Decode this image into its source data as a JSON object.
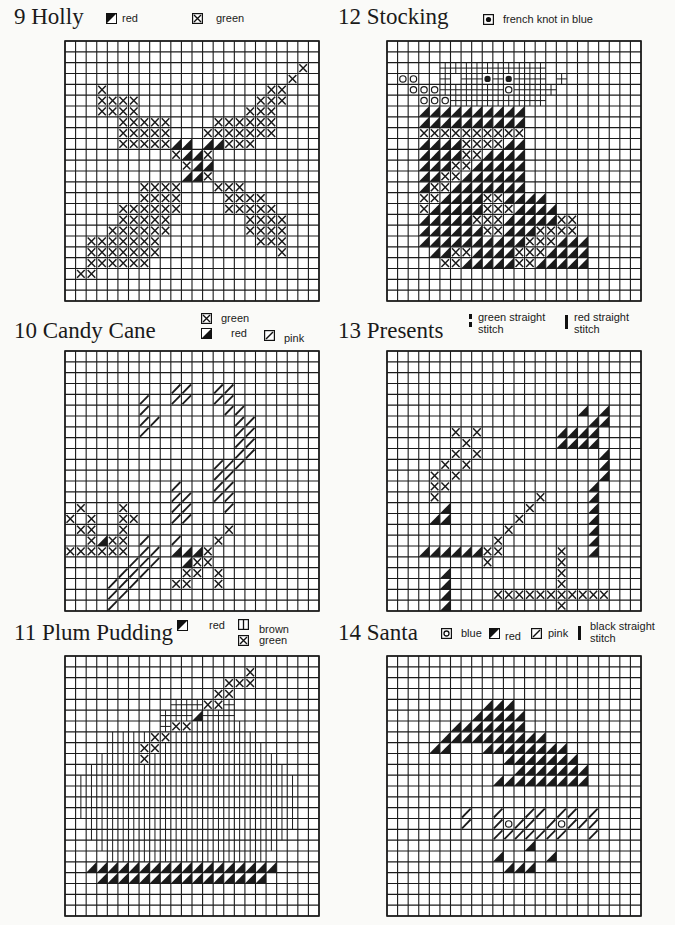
{
  "legend_symbols": {
    "X": "green-cross",
    "R": "red-half-fill",
    "P": "pink-diagonal",
    "O": "blue-circle",
    "K": "french-knot",
    "+": "white-cross-hatch",
    "B": "brown-vertical",
    "H": "brown-horizontal"
  },
  "panels": [
    {
      "id": "holly",
      "number": "9",
      "title": "9  Holly",
      "legend": [
        {
          "symbol": "red-half-fill-icon",
          "label": "red"
        },
        {
          "symbol": "green-cross-icon",
          "label": "green"
        }
      ],
      "rows": [
        "........................",
        "........................",
        "......................X.",
        ".....................X..",
        "...X...............XX...",
        "...XXXX...........XXX...",
        "...XXXX..........XXX....",
        ".....XXXXX....XXXXXX....",
        ".....XXXXX...XXXXXXX....",
        ".....XXXXXRR.RRXXX......",
        "..........XRRX..........",
        "...........XRR..........",
        "...........RRX..........",
        ".......XXXX...XXX.......",
        ".......XXXX....XXXX.....",
        ".....XXXXXX....XXXXX....",
        ".....XXXXX.......XXXX...",
        "....XXXXXX.......XXXX...",
        "..XXXXXXX.........XXX...",
        "..XXXXXXX...........X...",
        "..XXXXXX................",
        ".XX.....................",
        "........................",
        "........................"
      ]
    },
    {
      "id": "candy-cane",
      "number": "10",
      "title": "10  Candy Cane",
      "legend": [
        {
          "symbol": "green-cross-icon",
          "label": "green"
        },
        {
          "symbol": "red-half-fill-icon",
          "label": "red"
        },
        {
          "symbol": "pink-diagonal-icon",
          "label": "pink"
        }
      ],
      "rows": [
        "........................",
        "........................",
        "........................",
        "..........PP..PP........",
        ".......P..PP..PP........",
        ".......P.......PP.......",
        ".......PP.......PP......",
        ".......P........PP......",
        "................PP......",
        "................PP......",
        "..............PPP.......",
        "..............PP........",
        "..........P...PP........",
        "..........PP..PP........",
        ".X...X....PP...P........",
        "X.X..XX...PP............",
        ".XX..X.........X........",
        "..XRXX.P..P...X.........",
        "XXXXXX.PP.RRRX..........",
        "......PPP..RXX..........",
        ".....PPP...XX.X.........",
        "....PPP...XX..X.........",
        "....PP..................",
        "....P..................."
      ]
    },
    {
      "id": "plum-pudding",
      "number": "11",
      "title": "11  Plum Pudding",
      "legend": [
        {
          "symbol": "red-half-fill-icon",
          "label": "red"
        },
        {
          "symbol": "brown-vertical-icon",
          "label": "brown"
        },
        {
          "symbol": "green-cross-icon",
          "label": "green"
        }
      ],
      "rows": [
        "........................",
        ".................X......",
        "...............XXX......",
        "..............XX........",
        "..........HHHXXH........",
        ".........HHHRHHH........",
        ".........HXXBBBBB.......",
        "....BBBBXXBBBBBBBB......",
        "....BBBXXBBBBBBBBBB.....",
        "...BBBBXBBBBBBBBBBBB....",
        "..BBBBBBBBBBBBBBBBBBB...",
        ".BBBBBBBBBBBBBBBBBBBBB..",
        ".BBBBBBBBBBBBBBBBBBBBB..",
        ".BBBBBBBBBBBBBBBBBBBBB..",
        ".BBBBBBBBBBBBBBBBBBBBB..",
        "..BBBBBBBBBBBBBBBBBBBB..",
        "..BBBBBBBBBBBBBBBBBBB...",
        "...BBBBBBBBBBBBBBBBB....",
        "....BBBBBBBBBBBBBBB.....",
        "..RRRRRRRRRRRRRRRRRR....",
        "...RRRRRRRRRRRRRRRR.....",
        "........................",
        "........................",
        "........................"
      ]
    },
    {
      "id": "stocking",
      "number": "12",
      "title": "12  Stocking",
      "legend": [
        {
          "symbol": "french-knot-icon",
          "label": "french knot in blue"
        }
      ],
      "rows": [
        "........................",
        "........................",
        ".....++++++++++.........",
        ".OO..+.++K+K+++.+.......",
        "..OOO++++++O++++........",
        "...OOO+++++++++.........",
        "...RRRRRRRRRR...........",
        "...RRRRRRRRRR...........",
        "...XXXXXXXXXX...........",
        "...RRRRXXXXRR...........",
        "...RRRRXXRRRR...........",
        "...RRRXXRRRRR...........",
        "...RRXXRRRRRR...........",
        "...RXXRRRRRRR...........",
        "...XXRRRRXXRRRR.........",
        "...XRRRRRXXXRRRR........",
        "...RRRRRXXXRRRRRXX......",
        "...RRRRRRXXRRRXXXX......",
        "...RRRRRRRRRRXXXRRR.....",
        "....RRXXRRRRXXXRRRR.....",
        ".....XXRRRRRXXRRRRR.....",
        "........................",
        "........................",
        "........................"
      ]
    },
    {
      "id": "presents",
      "number": "13",
      "title": "13  Presents",
      "legend": [
        {
          "symbol": "green-dashed-stitch-icon",
          "label": "green straight  stitch"
        },
        {
          "symbol": "red-straight-stitch-icon",
          "label": "red straight  stitch"
        }
      ],
      "rows": [
        "........................",
        "........................",
        "........................",
        "........................",
        "........................",
        "..................R.R...",
        "...................RR...",
        "......X.X.......RRRR....",
        ".......X........RRRR....",
        "......X.X...........R...",
        ".....X.X............R...",
        "....X.X.............R...",
        "....XX.............R....",
        "....X.........X....R....",
        ".....R.......X.....R....",
        "....RR......X......R....",
        "...........X.......R....",
        "..........X........R....",
        "...RRRRRRXX.....X..R....",
        ".........X......X.......",
        ".....R..........X.......",
        ".....R..........X.......",
        ".....R....XXXXXXXXXXX...",
        ".....R..........X......."
      ]
    },
    {
      "id": "santa",
      "number": "14",
      "title": "14  Santa",
      "legend": [
        {
          "symbol": "blue-circle-icon",
          "label": "blue"
        },
        {
          "symbol": "red-half-fill-icon",
          "label": "red"
        },
        {
          "symbol": "pink-diagonal-icon",
          "label": "pink"
        },
        {
          "symbol": "black-straight-stitch-icon",
          "label": "black straight stitch"
        }
      ],
      "rows": [
        "........................",
        "........................",
        "........................",
        "........................",
        ".........RRR............",
        "........RRRRR...........",
        "......RRRRRRR...........",
        ".....RRRRRRRRRR.........",
        "....RR...RRRRRRRR.......",
        "...........RRRRRRR......",
        "............RRRRRRR.....",
        "..........RRRRRRRRR.....",
        "........................",
        "........................",
        ".......P..P..PP.PP.P....",
        ".......P..POPP.POPPP....",
        "..........PPPPPPP..P....",
        ".............R..........",
        "..........R....R........",
        "...........RRR..........",
        "........................",
        "........................",
        "........................",
        "........................"
      ]
    }
  ]
}
